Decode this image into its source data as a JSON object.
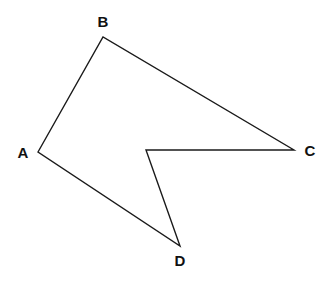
{
  "diagram": {
    "type": "polygon",
    "stroke_color": "#1a1a1a",
    "background": "#ffffff",
    "vertices": [
      {
        "name": "A",
        "x": 38,
        "y": 152,
        "label": "A",
        "label_x": 23,
        "label_y": 158
      },
      {
        "name": "B",
        "x": 103,
        "y": 37,
        "label": "B",
        "label_x": 103,
        "label_y": 27
      },
      {
        "name": "C",
        "x": 294,
        "y": 150,
        "label": "C",
        "label_x": 310,
        "label_y": 156
      },
      {
        "name": "E",
        "x": 146,
        "y": 150,
        "label": "",
        "label_x": 0,
        "label_y": 0
      },
      {
        "name": "D",
        "x": 180,
        "y": 246,
        "label": "D",
        "label_x": 180,
        "label_y": 266
      }
    ],
    "labels": {
      "A": "A",
      "B": "B",
      "C": "C",
      "D": "D"
    }
  }
}
